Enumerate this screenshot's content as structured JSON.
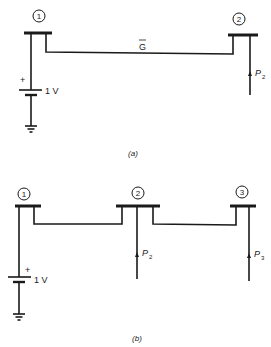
{
  "figure": {
    "panels": [
      {
        "caption": "(a)",
        "buses": [
          {
            "id": "1",
            "label": "1"
          },
          {
            "id": "2",
            "label": "2"
          }
        ],
        "source": {
          "plus": "+",
          "value": "1 V"
        },
        "line_label": "G",
        "injections": [
          {
            "bus": "2",
            "symbol": "P",
            "subscript": "2"
          }
        ]
      },
      {
        "caption": "(b)",
        "buses": [
          {
            "id": "1",
            "label": "1"
          },
          {
            "id": "2",
            "label": "2"
          },
          {
            "id": "3",
            "label": "3"
          }
        ],
        "source": {
          "plus": "+",
          "value": "1 V"
        },
        "injections": [
          {
            "bus": "2",
            "symbol": "P",
            "subscript": "2"
          },
          {
            "bus": "3",
            "symbol": "P",
            "subscript": "3"
          }
        ]
      }
    ]
  }
}
